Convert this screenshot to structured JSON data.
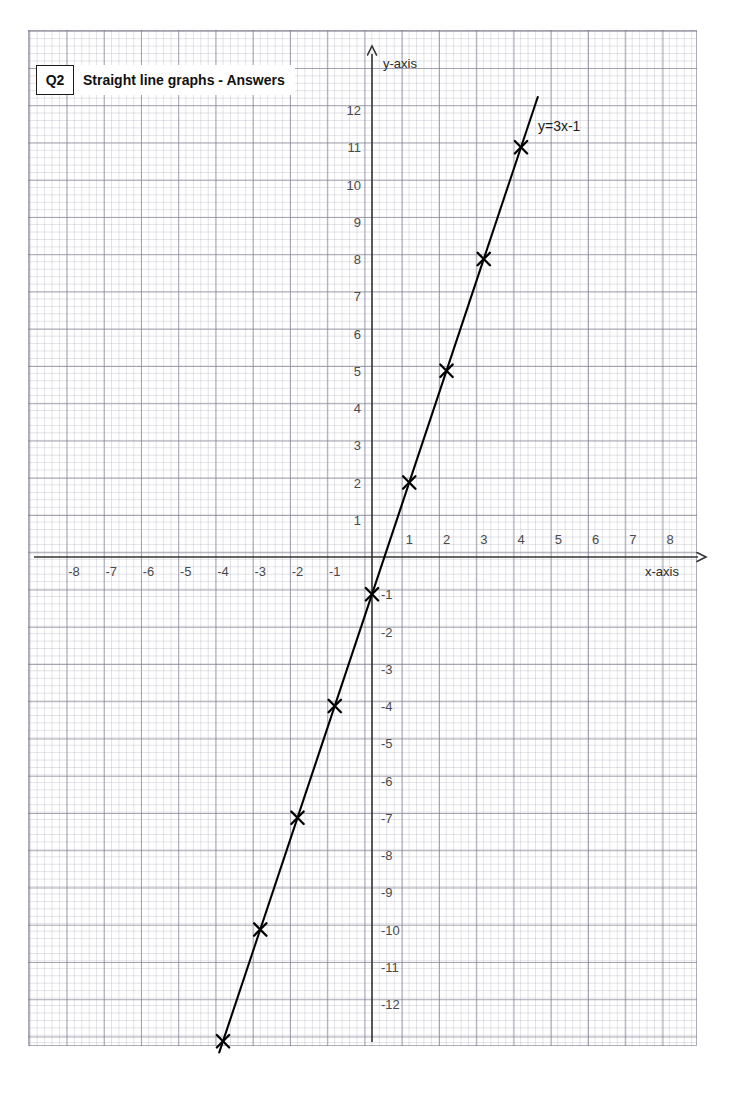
{
  "page": {
    "background": "#ffffff",
    "width": 732,
    "height": 1102
  },
  "header": {
    "question_number": "Q2",
    "title": "Straight line graphs - Answers"
  },
  "chart_data": {
    "type": "line",
    "title": "Straight line graphs - Answers",
    "equation_label": "y=3x-1",
    "xlabel": "x-axis",
    "ylabel": "y-axis",
    "grid": true,
    "grid_major_color": "#6e6e82",
    "grid_minor_color": "#9696aa",
    "axis_color": "#333333",
    "line_color": "#000000",
    "marker": "cross",
    "xlim": [
      -9,
      9
    ],
    "ylim": [
      -13.5,
      12.8
    ],
    "x_ticks": [
      -8,
      -7,
      -6,
      -5,
      -4,
      -3,
      -2,
      -1,
      1,
      2,
      3,
      4,
      5,
      6,
      7,
      8
    ],
    "y_ticks": [
      12,
      11,
      10,
      9,
      8,
      7,
      6,
      5,
      4,
      3,
      2,
      1,
      -1,
      -2,
      -3,
      -4,
      -5,
      -6,
      -7,
      -8,
      -9,
      -10,
      -11,
      -12
    ],
    "x_tick_labels": [
      "-8",
      "-7",
      "-6",
      "-5",
      "-4",
      "-3",
      "-2",
      "-1",
      "1",
      "2",
      "3",
      "4",
      "5",
      "6",
      "7",
      "8"
    ],
    "y_tick_labels": [
      "12",
      "11",
      "10",
      "9",
      "8",
      "7",
      "6",
      "5",
      "4",
      "3",
      "2",
      "1",
      "-1",
      "-2",
      "-3",
      "-4",
      "-5",
      "-6",
      "-7",
      "-8",
      "-9",
      "-10",
      "-11",
      "-12"
    ],
    "series": [
      {
        "name": "y=3x-1",
        "x": [
          -4,
          -3,
          -2,
          -1,
          0,
          1,
          2,
          3,
          4
        ],
        "values": [
          -13,
          -10,
          -7,
          -4,
          -1,
          2,
          5,
          8,
          11
        ]
      }
    ],
    "line_segment_endpoints": {
      "start": [
        -4.1,
        -13.3
      ],
      "end": [
        4.45,
        12.35
      ]
    }
  }
}
